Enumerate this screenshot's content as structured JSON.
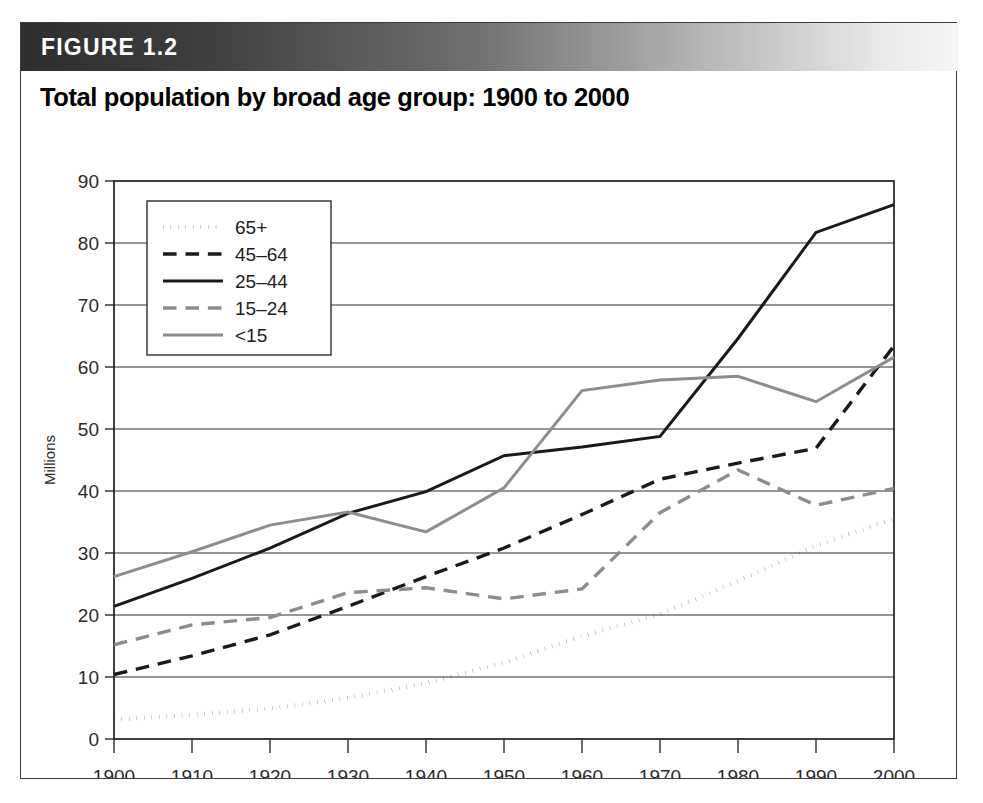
{
  "figure": {
    "banner_label": "FIGURE 1.2",
    "title": "Total population by broad age group: 1900 to 2000"
  },
  "colors": {
    "black": "#1a1a1a",
    "gray": "#8d8d8d",
    "frame": "#2b2b2b",
    "banner_dark": "#2e2e2e",
    "banner_light": "#f6f6f6",
    "background": "#ffffff"
  },
  "chart_data": {
    "type": "line",
    "title": "Total population by broad age group: 1900 to 2000",
    "subtitle": "",
    "xlabel": "",
    "ylabel": "Millions",
    "x": [
      1900,
      1910,
      1920,
      1930,
      1940,
      1950,
      1960,
      1970,
      1980,
      1990,
      2000
    ],
    "categories": [
      "1900",
      "1910",
      "1920",
      "1930",
      "1940",
      "1950",
      "1960",
      "1970",
      "1980",
      "1990",
      "2000"
    ],
    "xlim": [
      1900,
      2000
    ],
    "ylim": [
      0,
      90
    ],
    "yticks": [
      0,
      10,
      20,
      30,
      40,
      50,
      60,
      70,
      80,
      90
    ],
    "xticks": [
      1900,
      1910,
      1920,
      1930,
      1940,
      1950,
      1960,
      1970,
      1980,
      1990,
      2000
    ],
    "grid": true,
    "grid_axis": "y",
    "legend_position": "upper left",
    "series": [
      {
        "name": "65+",
        "style": "dotted",
        "color": "#1a1a1a",
        "values": [
          3.1,
          3.9,
          4.9,
          6.6,
          9.0,
          12.3,
          16.6,
          20.1,
          25.5,
          31.2,
          35.5
        ]
      },
      {
        "name": "45–64",
        "style": "dashed",
        "color": "#1a1a1a",
        "values": [
          10.4,
          13.4,
          16.8,
          21.4,
          26.2,
          30.8,
          36.2,
          41.9,
          44.5,
          46.9,
          63.4
        ]
      },
      {
        "name": "25–44",
        "style": "solid",
        "color": "#1a1a1a",
        "values": [
          21.4,
          25.9,
          30.8,
          36.4,
          39.9,
          45.7,
          47.1,
          48.8,
          64.6,
          81.7,
          86.2
        ]
      },
      {
        "name": "15–24",
        "style": "dashed",
        "color": "#8d8d8d",
        "values": [
          15.2,
          18.4,
          19.6,
          23.6,
          24.4,
          22.6,
          24.2,
          36.5,
          43.4,
          37.7,
          40.4
        ]
      },
      {
        "name": "<15",
        "style": "solid",
        "color": "#8d8d8d",
        "values": [
          26.2,
          30.2,
          34.5,
          36.6,
          33.4,
          40.5,
          56.2,
          57.9,
          58.5,
          54.4,
          61.6
        ]
      }
    ],
    "legend_entries": [
      "65+",
      "45–64",
      "25–44",
      "15–24",
      "<15"
    ]
  }
}
